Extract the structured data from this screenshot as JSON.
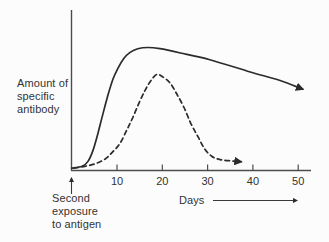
{
  "figure": {
    "ylabel_lines": [
      "Amount of",
      "specific",
      "antibody"
    ],
    "annotation_lines": [
      "Second",
      "exposure",
      "to antigen"
    ],
    "ink_color": "#2b2b2b",
    "axis_color": "#4c4c4c",
    "background": "#fcfcfc"
  },
  "chart_data": {
    "type": "line",
    "title": "",
    "xlabel": "Days",
    "ylabel": "Amount of specific antibody",
    "xlim": [
      0,
      53
    ],
    "ylim": [
      0,
      110
    ],
    "x_ticks": [
      10,
      20,
      30,
      40,
      50
    ],
    "y_ticks": [],
    "grid": false,
    "legend": "none",
    "annotations": [
      "Second exposure to antigen (upward arrow at day 0 on x-axis)",
      "both curves end in arrowheads"
    ],
    "series": [
      {
        "name": "secondary-response-solid",
        "style": "solid",
        "x": [
          0,
          2.3,
          3.6,
          4.7,
          5.8,
          6.9,
          8,
          9.1,
          10.2,
          11.5,
          12.9,
          14.6,
          16.8,
          19.5,
          24,
          30.5,
          39.4,
          46,
          51
        ],
        "y": [
          1.5,
          3,
          7,
          16,
          30,
          46,
          61,
          74,
          83,
          91,
          96,
          99,
          100,
          99,
          95.5,
          90,
          80,
          73,
          66
        ]
      },
      {
        "name": "primary-response-dashed",
        "style": "dashed",
        "x": [
          0.5,
          2.9,
          5.1,
          7.4,
          9.1,
          10.7,
          12.2,
          13.5,
          14.9,
          16.2,
          17.5,
          18.8,
          20.1,
          21.7,
          23.2,
          24.8,
          26.3,
          27.9,
          29.4,
          31,
          32.8,
          35,
          37.4
        ],
        "y": [
          1.5,
          3,
          5,
          9,
          15,
          22,
          33,
          43,
          55,
          65,
          73,
          78,
          76,
          71,
          62,
          51,
          38,
          27,
          17,
          11,
          8.5,
          7.5,
          6.8
        ]
      }
    ]
  }
}
